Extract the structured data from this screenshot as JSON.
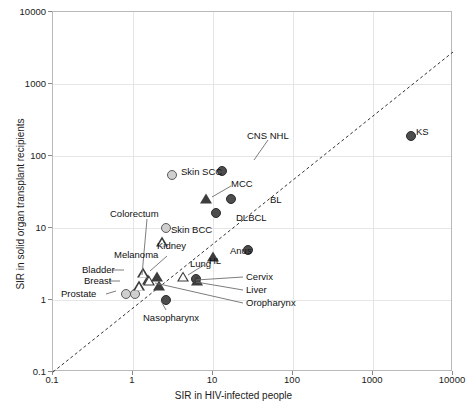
{
  "chart_data": {
    "type": "scatter",
    "title": "",
    "xlabel": "SIR in HIV-infected people",
    "ylabel": "SIR in solid organ transplant recipients",
    "xlim": [
      0.1,
      10000
    ],
    "ylim": [
      0.1,
      10000
    ],
    "xscale": "log",
    "yscale": "log",
    "xticks": [
      "0.1",
      "1",
      "10",
      "100",
      "1000",
      "10000"
    ],
    "yticks": [
      "0.1",
      "1",
      "10",
      "100",
      "1000",
      "10000"
    ],
    "xtick_values": [
      0.1,
      1,
      10,
      100,
      1000,
      10000
    ],
    "ytick_values": [
      0.1,
      1,
      10,
      100,
      1000,
      10000
    ],
    "grid": true,
    "legend": "none",
    "reference_line": {
      "type": "identity",
      "style": "dashed",
      "label": "y = x"
    },
    "marker_styles": {
      "filled-circle": "#4d4d4d",
      "light-circle": "#cfcfcf",
      "filled-triangle": "#3d3d3d",
      "open-triangle": "#ffffff"
    },
    "points": [
      {
        "name": "KS",
        "x": 3000,
        "y": 190,
        "marker": "filled-circle",
        "label_pos": "right"
      },
      {
        "name": "CNS NHL",
        "x": 13,
        "y": 62,
        "marker": "filled-circle",
        "label_pos": "leader-up"
      },
      {
        "name": "Skin SCC",
        "x": 3.1,
        "y": 55,
        "marker": "light-circle",
        "label_pos": "right"
      },
      {
        "name": "MCC",
        "x": 8.2,
        "y": 25,
        "marker": "filled-triangle",
        "label_pos": "leader-up"
      },
      {
        "name": "BL",
        "x": 17,
        "y": 25,
        "marker": "filled-circle",
        "label_pos": "right"
      },
      {
        "name": "DLBCL",
        "x": 11,
        "y": 16,
        "marker": "filled-circle",
        "label_pos": "right"
      },
      {
        "name": "Skin BCC",
        "x": 2.6,
        "y": 10,
        "marker": "light-circle",
        "label_pos": "right"
      },
      {
        "name": "Colorectum",
        "x": 1.6,
        "y": 1.85,
        "marker": "open-triangle",
        "label_pos": "leader-up"
      },
      {
        "name": "Kidney",
        "x": 2.3,
        "y": 6.4,
        "marker": "open-triangle",
        "label_pos": "right"
      },
      {
        "name": "Anus",
        "x": 27,
        "y": 5.0,
        "marker": "filled-circle",
        "label_pos": "right"
      },
      {
        "name": "HL",
        "x": 10,
        "y": 4.0,
        "marker": "filled-triangle",
        "label_pos": "right"
      },
      {
        "name": "Melanoma",
        "x": 2.0,
        "y": 2.1,
        "marker": "filled-triangle",
        "label_pos": "leader-up"
      },
      {
        "name": "Lung",
        "x": 4.2,
        "y": 2.1,
        "marker": "open-triangle",
        "label_pos": "leader-up"
      },
      {
        "name": "Bladder",
        "x": 1.35,
        "y": 2.35,
        "marker": "open-triangle",
        "label_pos": "leader-left"
      },
      {
        "name": "Breast",
        "x": 1.2,
        "y": 1.55,
        "marker": "open-triangle",
        "label_pos": "leader-left"
      },
      {
        "name": "Prostate",
        "x": 0.82,
        "y": 1.2,
        "marker": "light-circle",
        "label_pos": "leader-left"
      },
      {
        "name": "Cervix",
        "x": 6.1,
        "y": 1.95,
        "marker": "filled-circle",
        "label_pos": "leader-right"
      },
      {
        "name": "Liver",
        "x": 6.4,
        "y": 1.85,
        "marker": "filled-triangle",
        "label_pos": "leader-right"
      },
      {
        "name": "Oropharynx",
        "x": 2.1,
        "y": 1.55,
        "marker": "filled-triangle",
        "label_pos": "leader-right"
      },
      {
        "name": "Nasopharynx",
        "x": 2.6,
        "y": 1.0,
        "marker": "filled-circle",
        "label_pos": "leader-down"
      }
    ],
    "extra_unlabeled_markers": [
      {
        "x": 1.05,
        "y": 1.2,
        "marker": "light-circle"
      },
      {
        "x": 1.55,
        "y": 1.9,
        "marker": "open-triangle"
      }
    ]
  }
}
